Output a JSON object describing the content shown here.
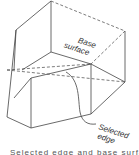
{
  "diagram": {
    "type": "technical-illustration",
    "labels": {
      "base_surface_line1": "Base",
      "base_surface_line2": "surface",
      "selected_edge_line1": "Selected",
      "selected_edge_line2": "edge"
    },
    "caption": "Selected edge and base surface",
    "colors": {
      "line": "#444444",
      "text": "#333333",
      "background": "#ffffff"
    }
  }
}
